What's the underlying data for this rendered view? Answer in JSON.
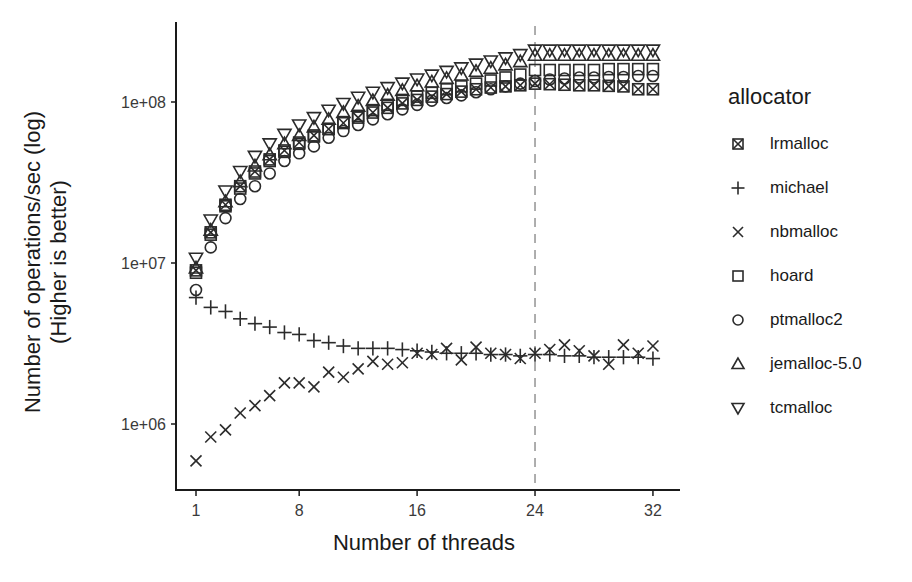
{
  "chart_data": {
    "type": "scatter",
    "title": "",
    "xlabel": "Number of threads",
    "ylabel": "Number of operations/sec (log)",
    "ylabel_line2": "(Higher is better)",
    "yscale": "log",
    "ylim": [
      450000,
      300000000
    ],
    "xlim": [
      0,
      33.5
    ],
    "x_ticks": [
      1,
      8,
      16,
      24,
      32
    ],
    "x_tick_labels": [
      "1",
      "8",
      "16",
      "24",
      "32"
    ],
    "y_ticks": [
      1000000,
      10000000,
      100000000
    ],
    "y_tick_labels": [
      "1e+06",
      "1e+07",
      "1e+08"
    ],
    "grid": false,
    "reference_line": {
      "x": 24,
      "style": "dashed",
      "color": "#9a9a9a"
    },
    "legend_title": "allocator",
    "legend_position": "right",
    "x": [
      1,
      2,
      3,
      4,
      5,
      6,
      7,
      8,
      9,
      10,
      11,
      12,
      13,
      14,
      15,
      16,
      17,
      18,
      19,
      20,
      21,
      22,
      23,
      24,
      25,
      26,
      27,
      28,
      29,
      30,
      31,
      32
    ],
    "series": [
      {
        "name": "lrmalloc",
        "marker": "square-x",
        "values": [
          9000000.0,
          15500000.0,
          23000000.0,
          30000000.0,
          37000000.0,
          44000000.0,
          50000000.0,
          56000000.0,
          62000000.0,
          68000000.0,
          74000000.0,
          80000000.0,
          86000000.0,
          92000000.0,
          98000000.0,
          103000000.0,
          108000000.0,
          112000000.0,
          116000000.0,
          120000000.0,
          123000000.0,
          125000000.0,
          127000000.0,
          130000000.0,
          129000000.0,
          128000000.0,
          127000000.0,
          127000000.0,
          126000000.0,
          125000000.0,
          120000000.0,
          120000000.0
        ]
      },
      {
        "name": "michael",
        "marker": "plus",
        "values": [
          6100000.0,
          5300000.0,
          5000000.0,
          4500000.0,
          4200000.0,
          4000000.0,
          3700000.0,
          3600000.0,
          3300000.0,
          3200000.0,
          3050000.0,
          2950000.0,
          2950000.0,
          2950000.0,
          2900000.0,
          2850000.0,
          2800000.0,
          2750000.0,
          2750000.0,
          2750000.0,
          2700000.0,
          2700000.0,
          2650000.0,
          2700000.0,
          2700000.0,
          2650000.0,
          2650000.0,
          2600000.0,
          2600000.0,
          2600000.0,
          2600000.0,
          2550000.0
        ]
      },
      {
        "name": "nbmalloc",
        "marker": "x",
        "values": [
          590000.0,
          830000.0,
          920000.0,
          1170000.0,
          1300000.0,
          1500000.0,
          1800000.0,
          1800000.0,
          1700000.0,
          2100000.0,
          1950000.0,
          2200000.0,
          2450000.0,
          2350000.0,
          2400000.0,
          2750000.0,
          2700000.0,
          2950000.0,
          2500000.0,
          3000000.0,
          2750000.0,
          2700000.0,
          2550000.0,
          2750000.0,
          2900000.0,
          3100000.0,
          2850000.0,
          2650000.0,
          2350000.0,
          3100000.0,
          2750000.0,
          3050000.0
        ]
      },
      {
        "name": "hoard",
        "marker": "square",
        "values": [
          8700000.0,
          15000000.0,
          22500000.0,
          29000000.0,
          36000000.0,
          43000000.0,
          49000000.0,
          55000000.0,
          61000000.0,
          68000000.0,
          75000000.0,
          82000000.0,
          89000000.0,
          96000000.0,
          103000000.0,
          108000000.0,
          114000000.0,
          120000000.0,
          125000000.0,
          130000000.0,
          136000000.0,
          142000000.0,
          148000000.0,
          158000000.0,
          158000000.0,
          158000000.0,
          158000000.0,
          158000000.0,
          160000000.0,
          160000000.0,
          160000000.0,
          160000000.0
        ]
      },
      {
        "name": "ptmalloc2",
        "marker": "circle",
        "values": [
          6800000.0,
          12500000.0,
          19000000.0,
          25000000.0,
          30000000.0,
          36000000.0,
          43000000.0,
          48000000.0,
          53000000.0,
          60000000.0,
          66000000.0,
          72000000.0,
          78000000.0,
          84000000.0,
          90000000.0,
          96000000.0,
          102000000.0,
          106000000.0,
          110000000.0,
          115000000.0,
          120000000.0,
          125000000.0,
          130000000.0,
          135000000.0,
          138000000.0,
          140000000.0,
          142000000.0,
          142000000.0,
          143000000.0,
          143000000.0,
          145000000.0,
          145000000.0
        ]
      },
      {
        "name": "jemalloc-5.0",
        "marker": "triangle-up",
        "values": [
          9300000.0,
          16000000.0,
          24000000.0,
          32000000.0,
          40000000.0,
          47000000.0,
          55000000.0,
          62000000.0,
          70000000.0,
          78000000.0,
          86000000.0,
          94000000.0,
          102000000.0,
          110000000.0,
          118000000.0,
          126000000.0,
          133000000.0,
          140000000.0,
          147000000.0,
          155000000.0,
          162000000.0,
          170000000.0,
          178000000.0,
          195000000.0,
          195000000.0,
          195000000.0,
          195000000.0,
          195000000.0,
          195000000.0,
          195000000.0,
          195000000.0,
          195000000.0
        ]
      },
      {
        "name": "tcmalloc",
        "marker": "triangle-down",
        "values": [
          10700000.0,
          18500000.0,
          28000000.0,
          37000000.0,
          46000000.0,
          55000000.0,
          63000000.0,
          72000000.0,
          80000000.0,
          89000000.0,
          98000000.0,
          107000000.0,
          115000000.0,
          123000000.0,
          131000000.0,
          139000000.0,
          147000000.0,
          155000000.0,
          163000000.0,
          172000000.0,
          180000000.0,
          188000000.0,
          197000000.0,
          210000000.0,
          210000000.0,
          210000000.0,
          210000000.0,
          210000000.0,
          210000000.0,
          210000000.0,
          210000000.0,
          210000000.0
        ]
      }
    ]
  },
  "legend": {
    "title": "allocator",
    "items": [
      {
        "label": "lrmalloc",
        "marker": "square-x"
      },
      {
        "label": "michael",
        "marker": "plus"
      },
      {
        "label": "nbmalloc",
        "marker": "x"
      },
      {
        "label": "hoard",
        "marker": "square"
      },
      {
        "label": "ptmalloc2",
        "marker": "circle"
      },
      {
        "label": "jemalloc-5.0",
        "marker": "triangle-up"
      },
      {
        "label": "tcmalloc",
        "marker": "triangle-down"
      }
    ]
  },
  "axes": {
    "x_title": "Number of threads",
    "y_title_line1": "Number of operations/sec (log)",
    "y_title_line2": "(Higher is better)"
  },
  "colors": {
    "ink": "#2b2b2b",
    "axis": "#1a1a1a",
    "reference_line": "#9a9a9a"
  }
}
